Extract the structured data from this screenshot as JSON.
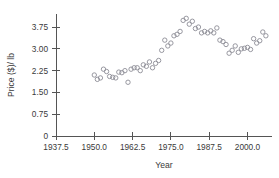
{
  "chart_data": {
    "type": "scatter",
    "title": "",
    "xlabel": "Year",
    "ylabel": "Price ($)/ lb",
    "xlim": [
      1937.5,
      2008.0
    ],
    "ylim": [
      0,
      4.2
    ],
    "xticks": [
      1937.5,
      1950.0,
      1962.5,
      1975.0,
      1987.5,
      2000.0
    ],
    "xtick_labels": [
      "1937.5",
      "1950.0",
      "1962.5",
      "1975.0",
      "1987.5",
      "2000.0"
    ],
    "yticks": [
      0,
      0.75,
      1.5,
      2.25,
      3.0,
      3.75
    ],
    "ytick_labels": [
      "0",
      "0.75",
      "1.50",
      "2.25",
      "3.00",
      "3.75"
    ],
    "grid": false,
    "legend": false,
    "marker": "open-circle",
    "marker_color": "#8d8d96",
    "x": [
      1950.0,
      1951.0,
      1952.0,
      1953.0,
      1954.0,
      1955.0,
      1956.0,
      1957.0,
      1958.0,
      1959.0,
      1960.0,
      1961.0,
      1962.0,
      1963.0,
      1964.0,
      1965.0,
      1966.0,
      1967.0,
      1968.0,
      1969.0,
      1970.0,
      1971.0,
      1972.0,
      1973.0,
      1974.0,
      1975.0,
      1976.0,
      1977.0,
      1978.0,
      1979.0,
      1980.0,
      1981.0,
      1982.0,
      1983.0,
      1984.0,
      1985.0,
      1986.0,
      1987.0,
      1988.0,
      1989.0,
      1990.0,
      1991.0,
      1992.0,
      1993.0,
      1994.0,
      1995.0,
      1996.0,
      1997.0,
      1998.0,
      1999.0,
      2000.0,
      2001.0,
      2002.0,
      2003.0,
      2004.0,
      2005.0,
      2006.0
    ],
    "y": [
      2.1,
      1.95,
      2.0,
      2.3,
      2.22,
      2.05,
      2.02,
      2.0,
      2.2,
      2.18,
      2.25,
      1.85,
      2.3,
      2.35,
      2.35,
      2.25,
      2.45,
      2.4,
      2.55,
      2.35,
      2.5,
      2.6,
      2.95,
      3.3,
      3.1,
      3.2,
      3.45,
      3.5,
      3.6,
      3.98,
      4.05,
      3.85,
      3.95,
      3.7,
      3.75,
      3.55,
      3.6,
      3.55,
      3.62,
      3.55,
      3.72,
      3.3,
      3.25,
      3.15,
      2.85,
      2.95,
      3.1,
      2.88,
      3.0,
      3.02,
      3.05,
      2.98,
      3.35,
      3.2,
      3.28,
      3.58,
      3.45
    ]
  }
}
